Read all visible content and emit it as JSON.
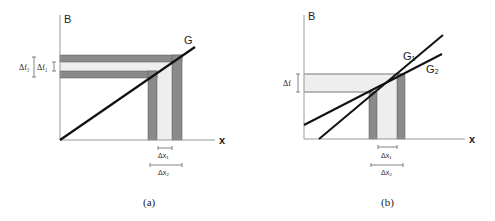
{
  "panel_a": {
    "y_axis_label": "B",
    "x_axis_label": "x",
    "line_label": "G",
    "delta_f2_label": "Δf₂",
    "delta_f1_label": "Δf₁",
    "delta_x1_label": "Δx₁",
    "delta_x2_label": "Δx₂",
    "caption": "(a)"
  },
  "panel_b": {
    "y_axis_label": "B",
    "x_axis_label": "x",
    "line1_label": "G₁",
    "line2_label": "G₂",
    "delta_f_label": "Δf",
    "delta_x1_label": "Δx₁",
    "delta_x2_label": "Δx₂",
    "caption": "(b)"
  },
  "colors": {
    "dark_band": "#8a8a8a",
    "light_band": "#eeeeee",
    "axis": "#999999",
    "line": "#111111"
  }
}
